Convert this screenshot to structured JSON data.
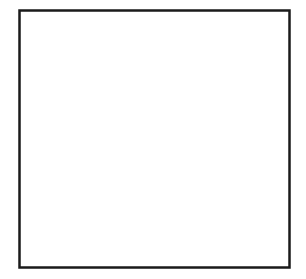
{
  "figure": {
    "type": "coordinate-plane",
    "x_axis_label": "x",
    "y_axis_label": "y",
    "tick_labels": {
      "x": [
        {
          "value": -3,
          "text": "−3"
        },
        {
          "value": 4,
          "text": "4"
        }
      ],
      "y": [
        {
          "value": 4,
          "text": "4"
        },
        {
          "value": -2,
          "text": "−2"
        }
      ]
    },
    "x_range": [
      -4,
      6
    ],
    "y_range": [
      -3,
      7
    ],
    "grid": true,
    "shape": "square",
    "vertices": [
      {
        "x": 1,
        "y": 6
      },
      {
        "x": 5,
        "y": 2
      },
      {
        "x": 1,
        "y": -2
      },
      {
        "x": -3,
        "y": 2
      }
    ],
    "colors": {
      "axis": "#1a1a1a",
      "grid": "#d9d9d9",
      "shape": "#111111",
      "frame": "#1a1a1a"
    }
  }
}
